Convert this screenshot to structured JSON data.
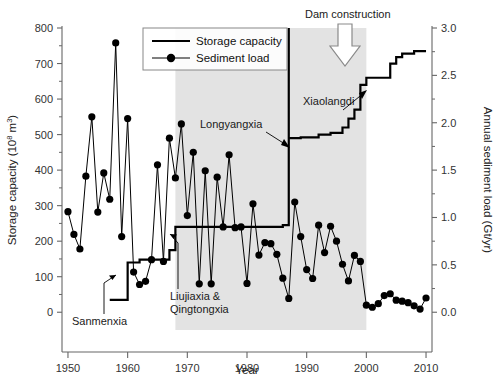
{
  "chart_data": {
    "type": "line",
    "title": "",
    "xlabel": "Year",
    "ylabel": "Storage capacity (10^8 m^3)",
    "y2label": "Annual sediment load (Gt/yr)",
    "xlim": [
      1949,
      2011
    ],
    "ylim": [
      -50,
      800
    ],
    "y2lim": [
      -0.1875,
      3.0
    ],
    "xticks": [
      1950,
      1960,
      1970,
      1980,
      1990,
      2000,
      2010
    ],
    "yticks": [
      0,
      100,
      200,
      300,
      400,
      500,
      600,
      700,
      800
    ],
    "yticks_minor": [
      50,
      150,
      250,
      350,
      450,
      550,
      650,
      750
    ],
    "y2ticks": [
      "0.0",
      "0.5",
      "1.0",
      "1.5",
      "2.0",
      "2.5",
      "3.0"
    ],
    "grid": false,
    "legend_position": "top-center",
    "series": [
      {
        "name": "Storage capacity",
        "axis": "left",
        "style": "step",
        "color": "#000000",
        "points": [
          [
            1957,
            35
          ],
          [
            1960,
            35
          ],
          [
            1960,
            140
          ],
          [
            1962,
            140
          ],
          [
            1962,
            148
          ],
          [
            1967,
            148
          ],
          [
            1967,
            175
          ],
          [
            1968,
            175
          ],
          [
            1968,
            240
          ],
          [
            1986,
            240
          ],
          [
            1986,
            245
          ],
          [
            1987,
            245
          ],
          [
            1987,
            1905
          ],
          [
            1987,
            490
          ],
          [
            1989,
            490
          ],
          [
            1989,
            492
          ],
          [
            1992,
            492
          ],
          [
            1992,
            500
          ],
          [
            1994,
            500
          ],
          [
            1994,
            505
          ],
          [
            1996,
            505
          ],
          [
            1996,
            520
          ],
          [
            1997,
            520
          ],
          [
            1997,
            545
          ],
          [
            1998,
            545
          ],
          [
            1998,
            570
          ],
          [
            1999,
            570
          ],
          [
            1999,
            640
          ],
          [
            2000,
            640
          ],
          [
            2000,
            660
          ],
          [
            2004,
            660
          ],
          [
            2004,
            700
          ],
          [
            2005,
            700
          ],
          [
            2005,
            718
          ],
          [
            2006,
            718
          ],
          [
            2006,
            728
          ],
          [
            2008,
            728
          ],
          [
            2008,
            735
          ],
          [
            2010,
            735
          ]
        ]
      },
      {
        "name": "Sediment load",
        "axis": "right",
        "style": "line-markers",
        "color": "#000000",
        "marker": "filled-circle",
        "values_left_units": [
          [
            1950,
            283
          ],
          [
            1951,
            219
          ],
          [
            1952,
            178
          ],
          [
            1953,
            383
          ],
          [
            1954,
            550
          ],
          [
            1955,
            282
          ],
          [
            1956,
            392
          ],
          [
            1957,
            318
          ],
          [
            1958,
            758
          ],
          [
            1959,
            213
          ],
          [
            1960,
            545
          ],
          [
            1961,
            113
          ],
          [
            1962,
            78
          ],
          [
            1963,
            87
          ],
          [
            1964,
            148
          ],
          [
            1965,
            415
          ],
          [
            1966,
            143
          ],
          [
            1967,
            490
          ],
          [
            1968,
            378
          ],
          [
            1969,
            530
          ],
          [
            1970,
            272
          ],
          [
            1971,
            450
          ],
          [
            1972,
            80
          ],
          [
            1973,
            398
          ],
          [
            1974,
            80
          ],
          [
            1975,
            380
          ],
          [
            1976,
            240
          ],
          [
            1977,
            443
          ],
          [
            1978,
            238
          ],
          [
            1979,
            240
          ],
          [
            1980,
            81
          ],
          [
            1981,
            305
          ],
          [
            1982,
            161
          ],
          [
            1983,
            196
          ],
          [
            1984,
            193
          ],
          [
            1985,
            163
          ],
          [
            1986,
            96
          ],
          [
            1987,
            39
          ],
          [
            1988,
            310
          ],
          [
            1989,
            213
          ],
          [
            1990,
            120
          ],
          [
            1991,
            95
          ],
          [
            1992,
            245
          ],
          [
            1993,
            168
          ],
          [
            1994,
            242
          ],
          [
            1995,
            200
          ],
          [
            1996,
            135
          ],
          [
            1997,
            88
          ],
          [
            1998,
            160
          ],
          [
            1999,
            143
          ],
          [
            2000,
            20
          ],
          [
            2001,
            14
          ],
          [
            2002,
            24
          ],
          [
            2003,
            47
          ],
          [
            2004,
            52
          ],
          [
            2005,
            34
          ],
          [
            2006,
            31
          ],
          [
            2007,
            27
          ],
          [
            2008,
            18
          ],
          [
            2009,
            9
          ],
          [
            2010,
            40
          ]
        ]
      }
    ],
    "shaded_region": {
      "x_start": 1968,
      "x_end": 2000,
      "color": "#e3e3e3"
    },
    "annotations": [
      {
        "text": "Dam construction",
        "x": 1991.5,
        "y": 800,
        "type": "arrow-label"
      },
      {
        "text": "Sanmenxia",
        "x": 1953.5,
        "y": -5,
        "type": "leader-label"
      },
      {
        "text": "Liujiaxia &",
        "x": 1970.5,
        "y": 18,
        "type": "leader-label"
      },
      {
        "text": "Qingtongxia",
        "x": 1970.5,
        "y": -18,
        "type": "leader-label"
      },
      {
        "text": "Longyangxia",
        "x": 1975.5,
        "y": 545,
        "type": "leader-label"
      },
      {
        "text": "Xiaolangdi",
        "x": 1991.0,
        "y": 600,
        "type": "leader-label"
      }
    ]
  },
  "legend": {
    "items": [
      {
        "label": "Storage capacity",
        "marker": "line"
      },
      {
        "label": "Sediment load",
        "marker": "line-dot"
      }
    ]
  },
  "axes": {
    "x_title": "Year",
    "y_left_title_main": "Storage capacity (10",
    "y_left_title_exp": "8",
    "y_left_title_tail": " m",
    "y_left_title_exp2": "3",
    "y_left_title_close": ")",
    "y_right_title": "Annual sediment load (Gt/yr)"
  },
  "colors": {
    "line": "#000000",
    "shade": "#e3e3e3",
    "axis": "#555555",
    "text": "#1a1a1a"
  }
}
